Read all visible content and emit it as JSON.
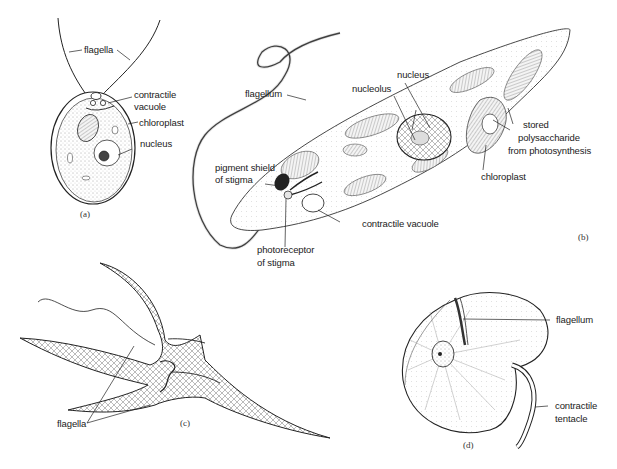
{
  "figure": {
    "panels": [
      {
        "id": "a",
        "caption": "(a)",
        "labels": [
          "flagella",
          "contractile",
          "vacuole",
          "chloroplast",
          "nucleus"
        ]
      },
      {
        "id": "b",
        "caption": "(b)",
        "labels": [
          "flagellum",
          "nucleus",
          "nucleolus",
          "stored",
          "polysaccharide",
          "from photosynthesis",
          "chloroplast",
          "pigment shield",
          "of stigma",
          "contractile vacuole",
          "photoreceptor",
          "of stigma"
        ]
      },
      {
        "id": "c",
        "caption": "(c)",
        "labels": [
          "flagella"
        ]
      },
      {
        "id": "d",
        "caption": "(d)",
        "labels": [
          "flagellum",
          "contractile",
          "tentacle"
        ]
      }
    ]
  },
  "a": {
    "caption": "(a)",
    "flagella": "flagella",
    "contractile_vacuole_1": "contractile",
    "contractile_vacuole_2": "vacuole",
    "chloroplast": "chloroplast",
    "nucleus": "nucleus"
  },
  "b": {
    "caption": "(b)",
    "flagellum": "flagellum",
    "nucleus": "nucleus",
    "nucleolus": "nucleolus",
    "stored_1": "stored",
    "stored_2": "polysaccharide",
    "stored_3": "from photosynthesis",
    "chloroplast": "chloroplast",
    "pigment_1": "pigment shield",
    "pigment_2": "of stigma",
    "contractile_vacuole": "contractile vacuole",
    "photoreceptor_1": "photoreceptor",
    "photoreceptor_2": "of stigma"
  },
  "c": {
    "caption": "(c)",
    "flagella": "flagella"
  },
  "d": {
    "caption": "(d)",
    "flagellum": "flagellum",
    "tentacle_1": "contractile",
    "tentacle_2": "tentacle"
  }
}
